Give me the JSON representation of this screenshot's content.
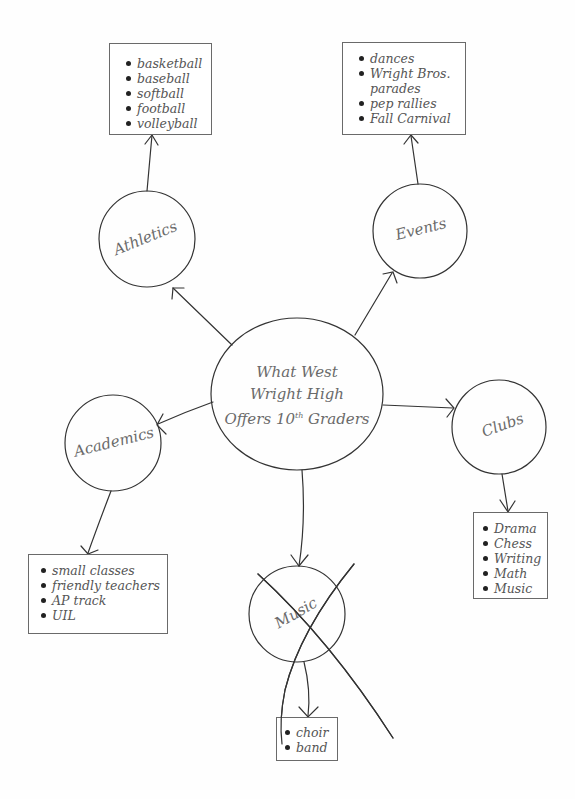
{
  "diagram": {
    "type": "concept-web",
    "center": {
      "line1": "What West",
      "line2": "Wright High",
      "line3_prefix": "Offers 10",
      "line3_sup": "th",
      "line3_suffix": " Graders"
    },
    "nodes": {
      "athletics": {
        "label": "Athletics",
        "items": [
          "basketball",
          "baseball",
          "softball",
          "football",
          "volleyball"
        ]
      },
      "events": {
        "label": "Events",
        "items": [
          "dances",
          "Wright Bros.",
          "parades",
          "pep rallies",
          "Fall Carnival"
        ]
      },
      "academics": {
        "label": "Academics",
        "items": [
          "small classes",
          "friendly teachers",
          "AP track",
          "UIL"
        ]
      },
      "clubs": {
        "label": "Clubs",
        "items": [
          "Drama",
          "Chess",
          "Writing",
          "Math",
          "Music"
        ]
      },
      "music": {
        "label": "Music",
        "crossed_out": true,
        "items": [
          "choir",
          "band"
        ]
      }
    },
    "colors": {
      "stroke": "#333333",
      "text": "#6a6a6a",
      "background": "#fefefe"
    }
  }
}
